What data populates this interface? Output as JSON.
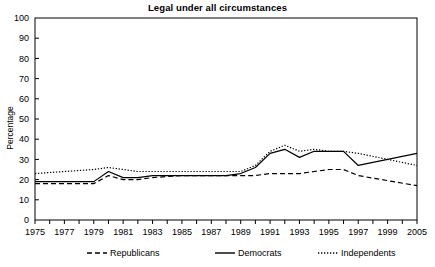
{
  "chart_data": {
    "type": "line",
    "title": "Legal under all circumstances",
    "xlabel": "",
    "ylabel": "Percentage",
    "ylim": [
      0,
      100
    ],
    "ytick_step": 10,
    "yticks": [
      0,
      10,
      20,
      30,
      40,
      50,
      60,
      70,
      80,
      90,
      100
    ],
    "xlim": [
      1975,
      2005
    ],
    "xticks": [
      1975,
      1976,
      1977,
      1978,
      1979,
      1980,
      1981,
      1982,
      1983,
      1984,
      1985,
      1986,
      1987,
      1988,
      1989,
      1990,
      1991,
      1992,
      1993,
      1994,
      1995,
      1996,
      1997,
      1998,
      1999,
      2000,
      2005
    ],
    "xtick_labels": [
      "1975",
      "",
      "1977",
      "",
      "1979",
      "",
      "1981",
      "",
      "1983",
      "",
      "1985",
      "",
      "1987",
      "",
      "1989",
      "",
      "1991",
      "",
      "1993",
      "",
      "1995",
      "",
      "1997",
      "",
      "1999",
      "",
      "2005"
    ],
    "grid": false,
    "legend_position": "below",
    "x": [
      1975,
      1977,
      1979,
      1980,
      1981,
      1982,
      1983,
      1985,
      1987,
      1988,
      1989,
      1990,
      1991,
      1992,
      1993,
      1994,
      1995,
      1996,
      1997,
      2005
    ],
    "series": [
      {
        "name": "Republicans",
        "style": "dashed",
        "color": "#000000",
        "values": [
          18,
          18,
          18,
          22,
          20,
          20,
          21,
          22,
          22,
          22,
          22,
          22,
          23,
          23,
          23,
          24,
          25,
          25,
          22,
          17
        ]
      },
      {
        "name": "Democrats",
        "style": "solid",
        "color": "#000000",
        "values": [
          19,
          19,
          19,
          24,
          21,
          21,
          22,
          22,
          22,
          22,
          23,
          26,
          33,
          35,
          31,
          34,
          34,
          34,
          27,
          33
        ]
      },
      {
        "name": "Independents",
        "style": "dotted",
        "color": "#000000",
        "values": [
          23,
          24,
          25,
          26,
          25,
          24,
          24,
          24,
          24,
          24,
          24,
          27,
          34,
          37,
          34,
          35,
          34,
          34,
          33,
          27
        ]
      }
    ]
  },
  "legend": {
    "items": [
      {
        "label": "Republicans",
        "style": "dashed"
      },
      {
        "label": "Democrats",
        "style": "solid"
      },
      {
        "label": "Independents",
        "style": "dotted"
      }
    ]
  }
}
